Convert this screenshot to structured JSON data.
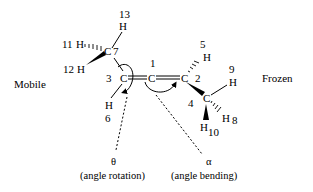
{
  "regions": {
    "mobile": "Mobile",
    "frozen": "Frozen"
  },
  "atoms": {
    "c1": {
      "symbol": "C",
      "index": "1"
    },
    "c2": {
      "symbol": "C",
      "index": "2"
    },
    "c3": {
      "symbol": "C",
      "index": "3"
    },
    "c4": {
      "symbol": "C",
      "index": "4"
    },
    "h5": {
      "symbol": "H",
      "index": "5"
    },
    "h6": {
      "symbol": "H",
      "index": "6"
    },
    "c7": {
      "symbol": "C",
      "index": "7"
    },
    "h8": {
      "symbol": "H",
      "index": "8"
    },
    "h9": {
      "symbol": "H",
      "index": "9"
    },
    "h10": {
      "symbol": "H",
      "index": "10"
    },
    "h11": {
      "symbol": "H",
      "index": "11"
    },
    "h12": {
      "symbol": "H",
      "index": "12"
    },
    "h13": {
      "symbol": "H",
      "index": "13"
    }
  },
  "annotations": {
    "theta": {
      "symbol": "θ",
      "caption": "(angle rotation)"
    },
    "alpha": {
      "symbol": "α",
      "caption": "(angle bending)"
    }
  }
}
